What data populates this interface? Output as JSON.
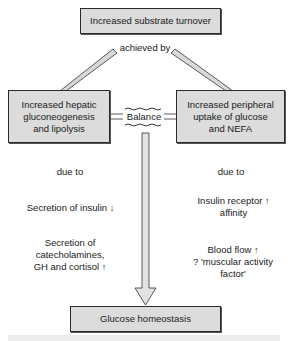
{
  "diagram": {
    "top_box": {
      "label": "Increased substrate turnover"
    },
    "connector_label": "achieved by",
    "left_box": {
      "lines": [
        "Increased hepatic",
        "gluconeogenesis",
        "and lipolysis"
      ]
    },
    "right_box": {
      "lines": [
        "Increased peripheral",
        "uptake of glucose",
        "and NEFA"
      ]
    },
    "balance_label": "Balance",
    "left_column": {
      "due_to": "due to",
      "items": [
        {
          "lines": [
            "Secretion of insulin"
          ],
          "arrow": "↓"
        },
        {
          "lines": [
            "Secretion of",
            "catecholamines,",
            "GH and cortisol"
          ],
          "arrow": "↑"
        }
      ]
    },
    "right_column": {
      "due_to": "due to",
      "items": [
        {
          "lines": [
            "Insulin receptor",
            "affinity"
          ],
          "arrow": "↑"
        },
        {
          "lines": [
            "Blood flow",
            "? 'muscular activity",
            "factor'"
          ],
          "arrow": "↑"
        }
      ]
    },
    "bottom_box": {
      "label": "Glucose homeostasis"
    },
    "colors": {
      "box_fill": "#dcdcdc",
      "stroke": "#2a2a2a",
      "band": "#ececec"
    }
  }
}
